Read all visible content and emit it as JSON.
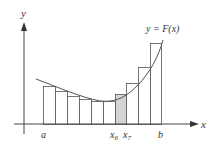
{
  "diagram": {
    "type": "riemann-sum",
    "axes": {
      "x_label": "x",
      "y_label": "y"
    },
    "curve_label": "y = F(x)",
    "tick_labels": {
      "a": "a",
      "b": "b",
      "x6": "x",
      "x6_sub": "6",
      "x7": "x",
      "x7_sub": "7"
    },
    "rectangles": [
      {
        "x0": 43,
        "x1": 55,
        "top": 86,
        "shaded": false
      },
      {
        "x0": 55,
        "x1": 67,
        "top": 91,
        "shaded": false
      },
      {
        "x0": 67,
        "x1": 79,
        "top": 96,
        "shaded": false
      },
      {
        "x0": 79,
        "x1": 91,
        "top": 99,
        "shaded": false
      },
      {
        "x0": 91,
        "x1": 103,
        "top": 101,
        "shaded": false
      },
      {
        "x0": 103,
        "x1": 115,
        "top": 101,
        "shaded": false
      },
      {
        "x0": 115,
        "x1": 126,
        "top": 94,
        "shaded": true
      },
      {
        "x0": 126,
        "x1": 138,
        "top": 83,
        "shaded": false
      },
      {
        "x0": 138,
        "x1": 150,
        "top": 67,
        "shaded": false
      },
      {
        "x0": 150,
        "x1": 161,
        "top": 43,
        "shaded": false
      }
    ],
    "colors": {
      "axis": "#444444",
      "curve": "#555555",
      "rect_stroke": "#555555",
      "shaded_fill": "#d4d4d4"
    }
  }
}
